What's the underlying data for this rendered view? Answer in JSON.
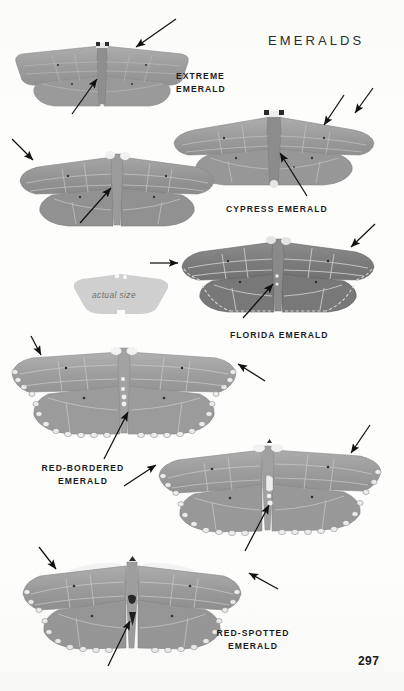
{
  "page": {
    "plate_title": "EMERALDS",
    "folio": "297",
    "background_color": "#fdfdfc",
    "ink_color": "#1c1c1c"
  },
  "actual_size": {
    "label": "actual size",
    "fill_color": "#cfcfcf"
  },
  "specimens": [
    {
      "id": "extreme-emerald",
      "common_name": "EXTREME",
      "common_name_line2": "EMERALD",
      "caption_x": 176,
      "caption_y": 70,
      "body_fill": "#9a9a9a",
      "wing_tone": "#a2a2a2",
      "border_style": "plain",
      "x": 12,
      "y": 38,
      "w": 180,
      "h": 74
    },
    {
      "id": "cypress-emerald",
      "common_name": "CYPRESS EMERALD",
      "common_name_line2": "",
      "caption_x": 226,
      "caption_y": 203,
      "body_fill": "#979797",
      "wing_tone": "#9e9e9e",
      "border_style": "plain",
      "x": 172,
      "y": 105,
      "w": 204,
      "h": 88
    },
    {
      "id": "unlabeled-emerald-left",
      "common_name": "",
      "common_name_line2": "",
      "caption_x": 0,
      "caption_y": 0,
      "body_fill": "#8f8f8f",
      "wing_tone": "#979797",
      "border_style": "plain",
      "x": 18,
      "y": 145,
      "w": 198,
      "h": 88
    },
    {
      "id": "florida-emerald",
      "common_name": "FLORIDA EMERALD",
      "common_name_line2": "",
      "caption_x": 230,
      "caption_y": 330,
      "body_fill": "#787878",
      "wing_tone": "#7e7e7e",
      "border_style": "scalloped",
      "x": 180,
      "y": 232,
      "w": 196,
      "h": 88
    },
    {
      "id": "red-bordered-emerald",
      "common_name": "RED-BORDERED",
      "common_name_line2": "EMERALD",
      "caption_x": 29,
      "caption_y": 462,
      "body_fill": "#a0a0a0",
      "wing_tone": "#a6a6a6",
      "border_style": "beaded",
      "x": 8,
      "y": 342,
      "w": 232,
      "h": 100
    },
    {
      "id": "middle-beaded-emerald",
      "common_name": "",
      "common_name_line2": "",
      "caption_x": 0,
      "caption_y": 0,
      "body_fill": "#9d9d9d",
      "wing_tone": "#a4a4a4",
      "border_style": "beaded",
      "x": 154,
      "y": 438,
      "w": 230,
      "h": 100
    },
    {
      "id": "red-spotted-emerald",
      "common_name": "RED-SPOTTED",
      "common_name_line2": "EMERALD",
      "caption_x": 200,
      "caption_y": 627,
      "body_fill": "#9b9b9b",
      "wing_tone": "#a2a2a2",
      "border_style": "beaded",
      "x": 18,
      "y": 548,
      "w": 228,
      "h": 108
    }
  ],
  "arrows": [
    {
      "id": "arrow-extreme-upper-right",
      "x1": 176,
      "y1": 19,
      "x2": 135,
      "y2": 48
    },
    {
      "id": "arrow-extreme-body",
      "x1": 72,
      "y1": 114,
      "x2": 96,
      "y2": 79
    },
    {
      "id": "arrow-left2-upper-left",
      "x1": 12,
      "y1": 139,
      "x2": 34,
      "y2": 161
    },
    {
      "id": "arrow-left2-body",
      "x1": 80,
      "y1": 223,
      "x2": 110,
      "y2": 187
    },
    {
      "id": "arrow-cypress-spot",
      "x1": 344,
      "y1": 95,
      "x2": 323,
      "y2": 126
    },
    {
      "id": "arrow-cypress-margin",
      "x1": 372,
      "y1": 88,
      "x2": 354,
      "y2": 114
    },
    {
      "id": "arrow-cypress-body",
      "x1": 307,
      "y1": 196,
      "x2": 279,
      "y2": 152
    },
    {
      "id": "arrow-florida-margin",
      "x1": 374,
      "y1": 224,
      "x2": 350,
      "y2": 247
    },
    {
      "id": "arrow-florida-costa",
      "x1": 152,
      "y1": 263,
      "x2": 177,
      "y2": 263
    },
    {
      "id": "arrow-florida-body",
      "x1": 243,
      "y1": 318,
      "x2": 272,
      "y2": 283
    },
    {
      "id": "arrow-redbordered-upper-left",
      "x1": 32,
      "y1": 336,
      "x2": 40,
      "y2": 354
    },
    {
      "id": "arrow-redbordered-margin",
      "x1": 264,
      "y1": 381,
      "x2": 238,
      "y2": 364
    },
    {
      "id": "arrow-redbordered-body",
      "x1": 104,
      "y1": 459,
      "x2": 127,
      "y2": 411
    },
    {
      "id": "arrow-middle-margin-left",
      "x1": 124,
      "y1": 485,
      "x2": 155,
      "y2": 465
    },
    {
      "id": "arrow-middle-upper-right",
      "x1": 369,
      "y1": 425,
      "x2": 350,
      "y2": 453
    },
    {
      "id": "arrow-middle-body",
      "x1": 245,
      "y1": 551,
      "x2": 268,
      "y2": 504
    },
    {
      "id": "arrow-redspotted-upper-left",
      "x1": 40,
      "y1": 548,
      "x2": 55,
      "y2": 568
    },
    {
      "id": "arrow-redspotted-margin",
      "x1": 277,
      "y1": 589,
      "x2": 248,
      "y2": 573
    },
    {
      "id": "arrow-redspotted-body",
      "x1": 108,
      "y1": 665,
      "x2": 129,
      "y2": 620
    }
  ]
}
